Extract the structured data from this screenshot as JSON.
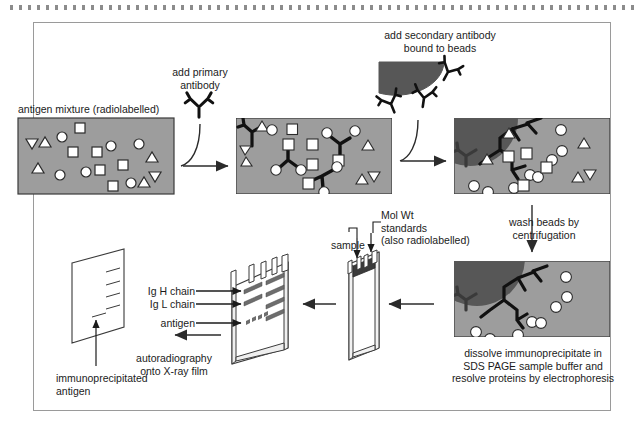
{
  "figure": {
    "title_visible": false,
    "type": "immunoprecipitation-workflow-diagram",
    "frame_border_color": "#9a9a9a",
    "page_background": "#ffffff"
  },
  "colors": {
    "tube_fill": "#9d9d9d",
    "tube_stroke": "#3a3a3a",
    "bead_fill": "#575757",
    "ink": "#1b1b1b",
    "shape_fill": "#ffffff",
    "shape_stroke": "#2b2b2b",
    "antibody": "#111111",
    "arrow": "#2b2b2b",
    "gel_band": "#6d6d6d",
    "dotted_rule": "#8c8c8c"
  },
  "labels": {
    "antigen_mixture": "antigen mixture (radiolabelled)",
    "add_primary_antibody": "add primary\nantibody",
    "add_secondary_antibody": "add secondary antibody\nbound to beads",
    "wash_beads": "wash beads by\ncentrifugation",
    "dissolve": "dissolve immunoprecipitate in\nSDS PAGE sample buffer and\nresolve proteins by electrophoresis",
    "mol_wt_standards": "Mol Wt\nstandards\n(also radiolabelled)",
    "sample": "sample",
    "ig_h_chain": "Ig H chain",
    "ig_l_chain": "Ig L chain",
    "antigen": "antigen",
    "autoradiography": "autoradiography\nonto X-ray film",
    "immunoprecipitated_antigen": "immunoprecipitated\nantigen"
  },
  "panels": [
    {
      "id": "tube-1",
      "name": "antigen-mixture-tube",
      "caption": "antigen mixture (radiolabelled)",
      "x": 18,
      "y": 118,
      "w": 156,
      "h": 76,
      "antibodies": 0,
      "beads": 0,
      "shapes": [
        {
          "type": "triangle-down",
          "x": 30,
          "y": 143
        },
        {
          "type": "triangle-up",
          "x": 45,
          "y": 140
        },
        {
          "type": "circle",
          "x": 62,
          "y": 137
        },
        {
          "type": "square",
          "x": 80,
          "y": 128
        },
        {
          "type": "square",
          "x": 73,
          "y": 152
        },
        {
          "type": "square",
          "x": 97,
          "y": 152
        },
        {
          "type": "circle",
          "x": 111,
          "y": 146
        },
        {
          "type": "circle",
          "x": 139,
          "y": 144
        },
        {
          "type": "triangle-up",
          "x": 38,
          "y": 168
        },
        {
          "type": "circle",
          "x": 60,
          "y": 175
        },
        {
          "type": "circle",
          "x": 86,
          "y": 172
        },
        {
          "type": "square",
          "x": 100,
          "y": 170
        },
        {
          "type": "square",
          "x": 123,
          "y": 165
        },
        {
          "type": "triangle-up",
          "x": 152,
          "y": 157
        },
        {
          "type": "triangle-down",
          "x": 155,
          "y": 177
        },
        {
          "type": "square",
          "x": 113,
          "y": 186
        },
        {
          "type": "circle",
          "x": 131,
          "y": 183
        },
        {
          "type": "triangle-up",
          "x": 144,
          "y": 182
        }
      ]
    },
    {
      "id": "tube-2",
      "name": "primary-antibody-bound-tube",
      "caption": "",
      "x": 236,
      "y": 118,
      "w": 156,
      "h": 76,
      "antibodies": 4,
      "beads": 0
    },
    {
      "id": "tube-3",
      "name": "secondary-antibody-bead-tube",
      "caption": "",
      "x": 454,
      "y": 118,
      "w": 156,
      "h": 76,
      "antibodies": 5,
      "beads": 1
    },
    {
      "id": "tube-4",
      "name": "washed-immunoprecipitate-tube",
      "caption": "",
      "x": 454,
      "y": 261,
      "w": 156,
      "h": 76,
      "antibodies": 4,
      "beads": 1
    }
  ],
  "gel": {
    "name": "sds-page-gel",
    "lanes": 5,
    "bands_per_lane": 4,
    "band_rows": [
      "Ig H chain",
      "Ig L chain",
      "antigen",
      "dye-front"
    ],
    "arrow_labels": [
      "Ig H chain",
      "Ig L chain",
      "antigen"
    ],
    "well_loading": [
      "sample",
      "Mol Wt standards (also radiolabelled)"
    ]
  },
  "film": {
    "name": "x-ray-film",
    "bands": 5,
    "highlight_label": "immunoprecipitated antigen"
  },
  "arrows": [
    {
      "name": "arrow-tube1-to-tube2",
      "direction": "right"
    },
    {
      "name": "arrow-tube2-to-tube3",
      "direction": "right"
    },
    {
      "name": "arrow-tube3-to-tube4",
      "direction": "down"
    },
    {
      "name": "arrow-tube4-to-gelplate",
      "direction": "left"
    },
    {
      "name": "arrow-gelplate-to-gel",
      "direction": "left"
    },
    {
      "name": "arrow-gel-to-film",
      "direction": "left"
    },
    {
      "name": "curved-arrow-primary-antibody",
      "direction": "curve-right"
    },
    {
      "name": "curved-arrow-secondary-antibody",
      "direction": "curve-right"
    }
  ]
}
